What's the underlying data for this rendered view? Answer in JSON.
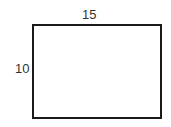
{
  "diagram": {
    "shape": "rectangle",
    "width_label": "15",
    "height_label": "10"
  }
}
